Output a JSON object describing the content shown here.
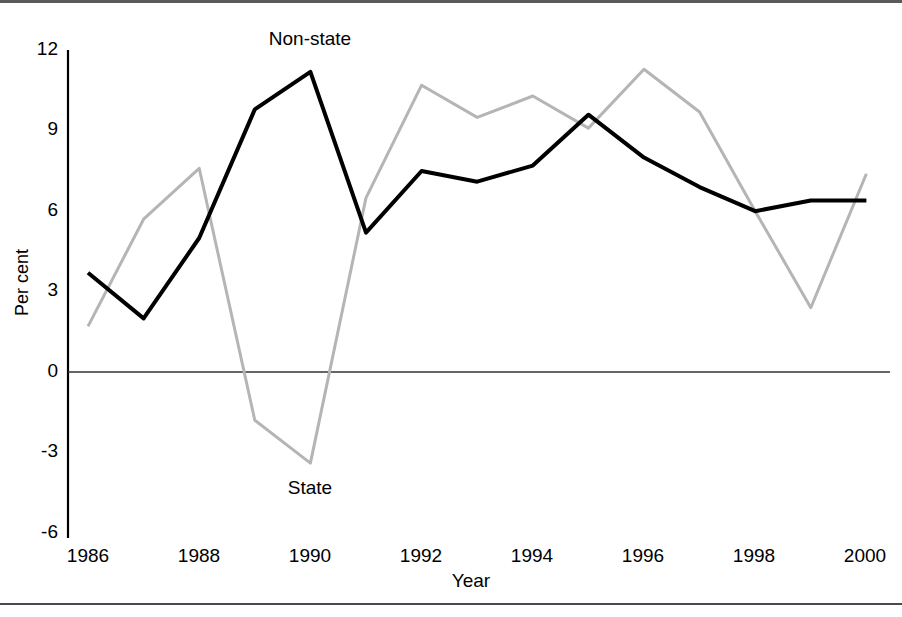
{
  "chart_data": {
    "type": "line",
    "title": "",
    "xlabel": "Year",
    "ylabel": "Per cent",
    "x": [
      1986,
      1987,
      1988,
      1989,
      1990,
      1991,
      1992,
      1993,
      1994,
      1995,
      1996,
      1997,
      1998,
      1999,
      2000
    ],
    "xtick_labels": [
      "1986",
      "1988",
      "1990",
      "1992",
      "1994",
      "1996",
      "1998",
      "2000"
    ],
    "xticks": [
      1986,
      1988,
      1990,
      1992,
      1994,
      1996,
      1998,
      2000
    ],
    "ytick_labels": [
      "12",
      "9",
      "6",
      "3",
      "0",
      "-3",
      "-6"
    ],
    "yticks": [
      12,
      9,
      6,
      3,
      0,
      -3,
      -6
    ],
    "ylim": [
      -6,
      12
    ],
    "xlim": [
      1986,
      2000
    ],
    "grid": false,
    "legend_position": "inline-annotations",
    "zero_line": true,
    "series": [
      {
        "name": "Non-state",
        "color": "#000000",
        "width": 4,
        "values": [
          3.7,
          2.0,
          5.0,
          9.8,
          11.2,
          5.2,
          7.5,
          7.1,
          7.7,
          9.6,
          8.0,
          6.9,
          6.0,
          6.4,
          6.4
        ]
      },
      {
        "name": "State",
        "color": "#b5b5b5",
        "width": 3,
        "values": [
          1.7,
          5.7,
          7.6,
          -1.8,
          -3.4,
          6.5,
          10.7,
          9.5,
          10.3,
          9.1,
          11.3,
          9.7,
          6.0,
          2.4,
          7.4
        ]
      }
    ],
    "annotations": [
      {
        "text": "Non-state",
        "x": 1990,
        "y": 12.6
      },
      {
        "text": "State",
        "x": 1990,
        "y": -4.0
      }
    ]
  }
}
